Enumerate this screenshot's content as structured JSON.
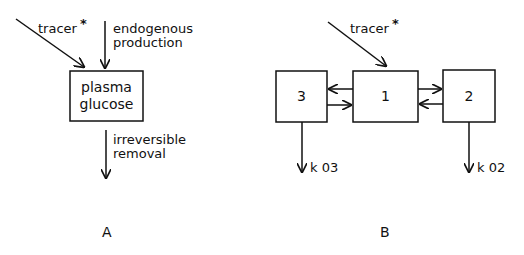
{
  "panels": [
    {
      "id": "A",
      "label": "A",
      "inputs": [
        {
          "label": "tracer",
          "marker": "*"
        },
        {
          "label_line1": "endogenous",
          "label_line2": "production"
        }
      ],
      "compartment": {
        "line1": "plasma",
        "line2": "glucose"
      },
      "output": {
        "label_line1": "irreversible",
        "label_line2": "removal"
      }
    },
    {
      "id": "B",
      "label": "B",
      "input": {
        "label": "tracer",
        "marker": "*",
        "target": "1"
      },
      "compartments": [
        {
          "id": "3",
          "label": "3"
        },
        {
          "id": "1",
          "label": "1"
        },
        {
          "id": "2",
          "label": "2"
        }
      ],
      "exchanges": [
        {
          "from": "1",
          "to": "3"
        },
        {
          "from": "3",
          "to": "1"
        },
        {
          "from": "1",
          "to": "2"
        },
        {
          "from": "2",
          "to": "1"
        }
      ],
      "outputs": [
        {
          "from": "3",
          "label": "k 03"
        },
        {
          "from": "2",
          "label": "k 02"
        }
      ]
    }
  ],
  "colors": {
    "stroke": "#111111",
    "background": "#ffffff"
  }
}
